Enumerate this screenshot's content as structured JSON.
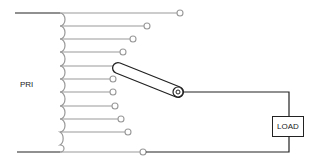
{
  "diagram": {
    "primary_label": "PRI",
    "load_label": "LOAD",
    "colors": {
      "wire_dark": "#222222",
      "wire_tap": "#999999"
    },
    "primary_leads": [
      {
        "y": 13
      },
      {
        "y": 152
      }
    ],
    "taps": [
      {
        "y": 13,
        "end_x": 180
      },
      {
        "y": 26,
        "end_x": 147
      },
      {
        "y": 39,
        "end_x": 133
      },
      {
        "y": 52,
        "end_x": 123
      },
      {
        "y": 66,
        "end_x": 118
      },
      {
        "y": 79,
        "end_x": 113
      },
      {
        "y": 92,
        "end_x": 113
      },
      {
        "y": 106,
        "end_x": 115
      },
      {
        "y": 119,
        "end_x": 121
      },
      {
        "y": 132,
        "end_x": 128
      },
      {
        "y": 145,
        "end_x": 143
      }
    ],
    "wiper": {
      "from": [
        118,
        68
      ],
      "to": [
        179,
        92
      ]
    }
  }
}
